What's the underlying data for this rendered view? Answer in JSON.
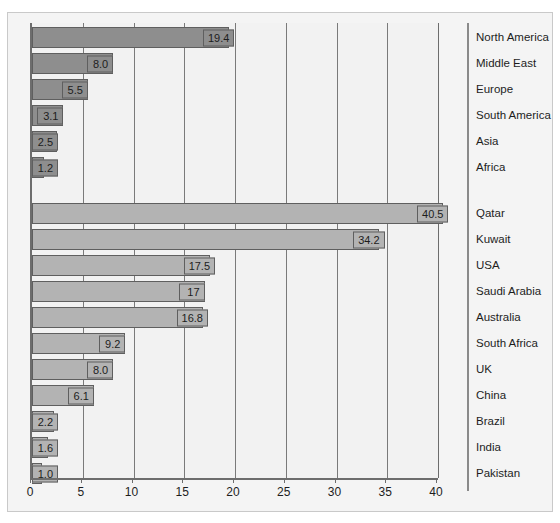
{
  "chart_data": {
    "type": "bar",
    "orientation": "horizontal",
    "title": "",
    "xlabel": "",
    "ylabel": "",
    "xlim": [
      0,
      40
    ],
    "xticks": [
      0,
      5,
      10,
      15,
      20,
      25,
      30,
      35,
      40
    ],
    "grid": true,
    "legend": "none",
    "groups": [
      {
        "name": "regions",
        "color": "#8e8e8e",
        "categories": [
          "North America",
          "Middle East",
          "Europe",
          "South America",
          "Asia",
          "Africa"
        ],
        "values": [
          19.4,
          8.0,
          5.5,
          3.1,
          2.5,
          1.2
        ],
        "labels": [
          "19.4",
          "8.0",
          "5.5",
          "3.1",
          "2.5",
          "1.2"
        ]
      },
      {
        "name": "countries",
        "color": "#b3b3b3",
        "categories": [
          "Qatar",
          "Kuwait",
          "USA",
          "Saudi Arabia",
          "Australia",
          "South Africa",
          "UK",
          "China",
          "Brazil",
          "India",
          "Pakistan"
        ],
        "values": [
          40.5,
          34.2,
          17.5,
          17,
          16.8,
          9.2,
          8.0,
          6.1,
          2.2,
          1.6,
          1.0
        ],
        "labels": [
          "40.5",
          "34.2",
          "17.5",
          "17",
          "16.8",
          "9.2",
          "8.0",
          "6.1",
          "2.2",
          "1.6",
          "1.0"
        ]
      }
    ]
  },
  "colors": {
    "group_a_bar": "#8e8e8e",
    "group_b_bar": "#b3b3b3",
    "bar_border": "#5f5f5f",
    "gridline": "#7a7a7a",
    "axis": "#6d6d6d",
    "plot_background": "#f2f2f2",
    "frame_background": "#f4f4f4",
    "frame_border": "#c9c9c9",
    "text": "#1d1d1d"
  }
}
